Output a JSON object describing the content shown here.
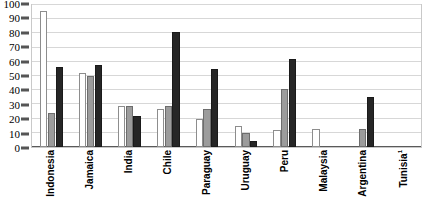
{
  "chart_data": {
    "type": "bar",
    "title": "",
    "subtitle": "",
    "xlabel": "",
    "ylabel": "",
    "ylim": [
      0,
      100
    ],
    "yticks": [
      0,
      10,
      20,
      30,
      40,
      50,
      60,
      70,
      80,
      90,
      100
    ],
    "grid": true,
    "legend": "none",
    "orientation": "vertical",
    "grouping": "clustered",
    "xtick_rotation": 90,
    "categories": [
      "Indonesia",
      "Jamaica",
      "India",
      "Chile",
      "Paraguay",
      "Uruguay",
      "Peru",
      "Malaysia",
      "Argentina",
      "Tunisia"
    ],
    "category_footnotes": {
      "Tunisia": "1"
    },
    "series": [
      {
        "name": "series-1",
        "color": "#ffffff",
        "fill": "white",
        "values": [
          96,
          52,
          29,
          27,
          20,
          15,
          12,
          13,
          null,
          null
        ]
      },
      {
        "name": "series-2",
        "color": "#9c9c9c",
        "fill": "gray",
        "values": [
          24,
          50,
          29,
          29,
          27,
          10,
          41,
          null,
          13,
          null
        ]
      },
      {
        "name": "series-3",
        "color": "#262626",
        "fill": "black",
        "values": [
          56,
          58,
          22,
          81,
          55,
          4,
          62,
          null,
          35,
          null
        ]
      }
    ]
  },
  "axis": {
    "y_tick_labels": [
      "100",
      "90",
      "80",
      "70",
      "60",
      "50",
      "40",
      "30",
      "20",
      "10",
      "0"
    ]
  },
  "colors": {
    "series_white": "#ffffff",
    "series_gray": "#9c9c9c",
    "series_black": "#262626",
    "gridline": "#d7d7d7",
    "frame": "#c9c9c9",
    "text": "#000000"
  }
}
